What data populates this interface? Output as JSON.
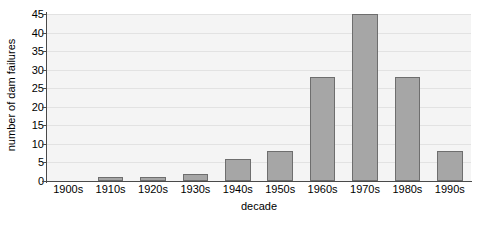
{
  "chart_data": {
    "type": "bar",
    "title": "",
    "xlabel": "decade",
    "ylabel": "number of dam failures",
    "categories": [
      "1900s",
      "1910s",
      "1920s",
      "1930s",
      "1940s",
      "1950s",
      "1960s",
      "1970s",
      "1980s",
      "1990s"
    ],
    "values": [
      0,
      1,
      1,
      2,
      6,
      8,
      28,
      45,
      28,
      8
    ],
    "ylim": [
      0,
      45
    ],
    "yticks": [
      0,
      5,
      10,
      15,
      20,
      25,
      30,
      35,
      40,
      45
    ],
    "ytick_labels": [
      "0",
      "5",
      "10",
      "15",
      "20",
      "25",
      "30",
      "35",
      "40",
      "45"
    ],
    "grid": true,
    "grid_axis": "y",
    "legend": false,
    "legend_position": "none",
    "bar_color": "#a6a6a6",
    "bar_edge_color": "#6e6e6e",
    "plot_background": "#f4f4f4",
    "grid_color": "#e2e2e2",
    "axis_color": "#4a4a4a",
    "figure_background": "#ffffff"
  }
}
